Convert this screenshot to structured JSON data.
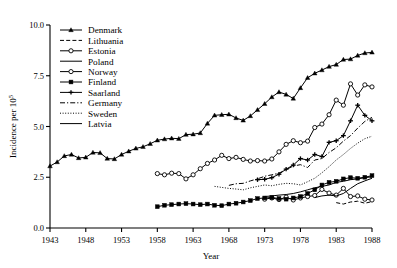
{
  "chart_data": {
    "type": "line",
    "title": "",
    "xlabel": "Year",
    "ylabel": "Incidence per 10⁵",
    "xlim": [
      1943,
      1988
    ],
    "ylim": [
      0.0,
      10.0
    ],
    "xticks": [
      1943,
      1948,
      1953,
      1958,
      1963,
      1968,
      1973,
      1978,
      1983,
      1988
    ],
    "xticklabels": [
      "1943",
      "1948",
      "1953",
      "1958",
      "1963",
      "1968",
      "1973",
      "1978",
      "1983",
      "1988"
    ],
    "yticks": [
      0.0,
      2.5,
      5.0,
      7.5,
      10.0
    ],
    "yticklabels": [
      "0.0",
      "2.5",
      "5.0",
      "7.5",
      "10.0"
    ],
    "grid": false,
    "legend_position": "upper-left-inside",
    "series": [
      {
        "name": "Denmark",
        "marker": "filled-triangle",
        "linestyle": "solid",
        "x": [
          1943,
          1944,
          1945,
          1946,
          1947,
          1948,
          1949,
          1950,
          1951,
          1952,
          1953,
          1954,
          1955,
          1956,
          1957,
          1958,
          1959,
          1960,
          1961,
          1962,
          1963,
          1964,
          1965,
          1966,
          1967,
          1968,
          1969,
          1970,
          1971,
          1972,
          1973,
          1974,
          1975,
          1976,
          1977,
          1978,
          1979,
          1980,
          1981,
          1982,
          1983,
          1984,
          1985,
          1986,
          1987,
          1988
        ],
        "values": [
          3.05,
          3.25,
          3.55,
          3.62,
          3.45,
          3.48,
          3.72,
          3.7,
          3.42,
          3.4,
          3.62,
          3.78,
          3.92,
          4.0,
          4.15,
          4.32,
          4.38,
          4.42,
          4.4,
          4.6,
          4.62,
          4.68,
          5.15,
          5.55,
          5.58,
          5.6,
          5.42,
          5.3,
          5.52,
          5.82,
          6.12,
          6.45,
          6.7,
          6.58,
          6.38,
          6.9,
          7.4,
          7.62,
          7.78,
          7.95,
          8.05,
          8.3,
          8.32,
          8.5,
          8.62,
          8.65
        ]
      },
      {
        "name": "Lithuania",
        "marker": "none",
        "linestyle": "dashed",
        "x": [
          1983,
          1984,
          1985,
          1986,
          1987,
          1988
        ],
        "values": [
          1.25,
          1.18,
          1.28,
          1.32,
          1.22,
          1.3
        ]
      },
      {
        "name": "Estonia",
        "marker": "open-circle",
        "linestyle": "solid",
        "x": [
          1958,
          1959,
          1960,
          1961,
          1962,
          1963,
          1964,
          1965,
          1966,
          1967,
          1968,
          1969,
          1970,
          1971,
          1972,
          1973,
          1974,
          1975,
          1976,
          1977,
          1978,
          1979,
          1980,
          1981,
          1982,
          1983,
          1984,
          1985,
          1986,
          1987,
          1988
        ],
        "values": [
          2.68,
          2.62,
          2.7,
          2.68,
          2.42,
          2.62,
          2.92,
          3.18,
          3.35,
          3.58,
          3.42,
          3.48,
          3.38,
          3.3,
          3.32,
          3.3,
          3.4,
          3.75,
          4.12,
          4.3,
          4.2,
          4.28,
          4.95,
          5.12,
          5.58,
          6.3,
          6.05,
          7.1,
          6.55,
          7.05,
          6.95
        ]
      },
      {
        "name": "Poland",
        "marker": "none",
        "linestyle": "solid",
        "x": [
          1973,
          1974,
          1975,
          1976,
          1977,
          1978,
          1979,
          1980,
          1981,
          1982,
          1983,
          1984,
          1985,
          1986,
          1987,
          1988
        ],
        "values": [
          1.55,
          1.58,
          1.62,
          1.65,
          1.7,
          1.78,
          1.88,
          1.98,
          2.05,
          2.12,
          2.25,
          2.3,
          2.38,
          2.42,
          2.48,
          2.52
        ]
      },
      {
        "name": "Norway",
        "marker": "open-circle",
        "linestyle": "solid",
        "x": [
          1973,
          1974,
          1975,
          1976,
          1977,
          1978,
          1979,
          1980,
          1981,
          1982,
          1983,
          1984,
          1985,
          1986,
          1987,
          1988
        ],
        "values": [
          1.42,
          1.48,
          1.4,
          1.52,
          1.38,
          1.48,
          1.55,
          1.6,
          1.9,
          1.72,
          1.62,
          1.95,
          1.55,
          1.58,
          1.42,
          1.38
        ]
      },
      {
        "name": "Finland",
        "marker": "filled-square",
        "linestyle": "solid",
        "x": [
          1958,
          1959,
          1960,
          1961,
          1962,
          1963,
          1964,
          1965,
          1966,
          1967,
          1968,
          1969,
          1970,
          1971,
          1972,
          1973,
          1974,
          1975,
          1976,
          1977,
          1978,
          1979,
          1980,
          1981,
          1982,
          1983,
          1984,
          1985,
          1986,
          1987,
          1988
        ],
        "values": [
          1.05,
          1.12,
          1.15,
          1.18,
          1.2,
          1.18,
          1.15,
          1.18,
          1.12,
          1.1,
          1.18,
          1.22,
          1.28,
          1.35,
          1.45,
          1.48,
          1.5,
          1.45,
          1.42,
          1.48,
          1.55,
          1.7,
          1.88,
          2.12,
          2.25,
          2.3,
          2.42,
          2.48,
          2.45,
          2.5,
          2.58
        ]
      },
      {
        "name": "Saarland",
        "marker": "filled-plus",
        "linestyle": "solid",
        "x": [
          1972,
          1973,
          1974,
          1975,
          1976,
          1977,
          1978,
          1979,
          1980,
          1981,
          1982,
          1983,
          1984,
          1985,
          1986,
          1987,
          1988
        ],
        "values": [
          2.38,
          2.4,
          2.48,
          2.65,
          2.9,
          3.1,
          3.42,
          3.35,
          3.62,
          3.52,
          4.22,
          4.3,
          4.55,
          5.28,
          6.05,
          5.55,
          5.28
        ]
      },
      {
        "name": "Germany",
        "marker": "none",
        "linestyle": "dashdot",
        "x": [
          1968,
          1969,
          1970,
          1971,
          1972,
          1973,
          1974,
          1975,
          1976,
          1977,
          1978,
          1979,
          1980,
          1981,
          1982,
          1983,
          1984,
          1985,
          1986,
          1987,
          1988
        ],
        "values": [
          2.1,
          2.18,
          2.2,
          2.32,
          2.42,
          2.55,
          2.62,
          2.7,
          2.88,
          3.05,
          3.12,
          2.98,
          3.35,
          3.42,
          3.72,
          3.95,
          4.28,
          4.55,
          4.92,
          5.25,
          5.45
        ]
      },
      {
        "name": "Sweden",
        "marker": "none",
        "linestyle": "dotted",
        "x": [
          1966,
          1967,
          1968,
          1969,
          1970,
          1971,
          1972,
          1973,
          1974,
          1975,
          1976,
          1977,
          1978,
          1979,
          1980,
          1981,
          1982,
          1983,
          1984,
          1985,
          1986,
          1987,
          1988
        ],
        "values": [
          2.05,
          2.0,
          1.95,
          1.92,
          1.88,
          1.98,
          2.05,
          2.12,
          2.08,
          2.15,
          2.2,
          2.18,
          2.12,
          2.28,
          2.45,
          2.72,
          3.02,
          3.35,
          3.62,
          3.92,
          4.18,
          4.4,
          4.52
        ]
      },
      {
        "name": "Latvia",
        "marker": "none",
        "linestyle": "solid",
        "x": [
          1980,
          1981,
          1982,
          1983,
          1984,
          1985,
          1986,
          1987,
          1988
        ],
        "values": [
          1.5,
          1.58,
          1.62,
          1.58,
          1.7,
          1.95,
          2.18,
          2.32,
          2.45
        ]
      }
    ]
  },
  "legend": {
    "items": [
      {
        "label": "Denmark"
      },
      {
        "label": "Lithuania"
      },
      {
        "label": "Estonia"
      },
      {
        "label": "Poland"
      },
      {
        "label": "Norway"
      },
      {
        "label": "Finland"
      },
      {
        "label": "Saarland"
      },
      {
        "label": "Germany"
      },
      {
        "label": "Sweden"
      },
      {
        "label": "Latvia"
      }
    ]
  },
  "colors": {
    "line": "#000000",
    "background": "#ffffff"
  }
}
